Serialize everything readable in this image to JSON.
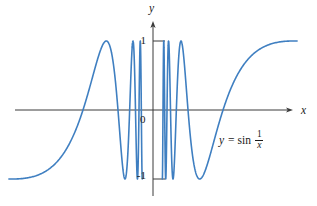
{
  "figure": {
    "background": "#ffffff",
    "axis_color": "#3a3a3a",
    "curve_color": "#3f7fc1",
    "text_color": "#1a1a1a"
  },
  "chart_data": {
    "type": "line",
    "title": "",
    "function": "y = sin(1/x)",
    "xlabel": "x",
    "ylabel": "y",
    "xlim": [
      -0.66,
      0.66
    ],
    "ylim": [
      -1,
      1
    ],
    "grid": false,
    "legend": "none",
    "y_ticks": [
      {
        "value": 1,
        "label": "1"
      },
      {
        "value": -1,
        "label": "-1"
      }
    ],
    "origin_label": "0",
    "domain_segments": [
      [
        -0.655,
        -0.04897
      ],
      [
        0.042441,
        0.655
      ]
    ],
    "key_points": {
      "right_maxima_x": [
        0.6366,
        0.1273,
        0.0707
      ],
      "right_minima_x": [
        0.2122,
        0.0909,
        0.0579,
        0.0424
      ],
      "left_maximum_x": -0.2122,
      "zero_crossings_x": [
        0.3183,
        0.1592,
        -0.3183,
        -0.1592
      ]
    },
    "annotation": {
      "var_y": "y",
      "mid": "= sin",
      "frac_num": "1",
      "frac_den": "x"
    },
    "layout": {
      "origin_px": [
        153,
        110
      ],
      "px_per_unit": [
        220,
        69
      ],
      "x_axis": {
        "x_from": 15,
        "x_to": 293,
        "y": 110
      },
      "y_axis": {
        "y_from": 21,
        "y_to": 196,
        "x": 153
      },
      "tick_len": 12,
      "curve_width": 1.6,
      "axis_width": 1
    }
  }
}
